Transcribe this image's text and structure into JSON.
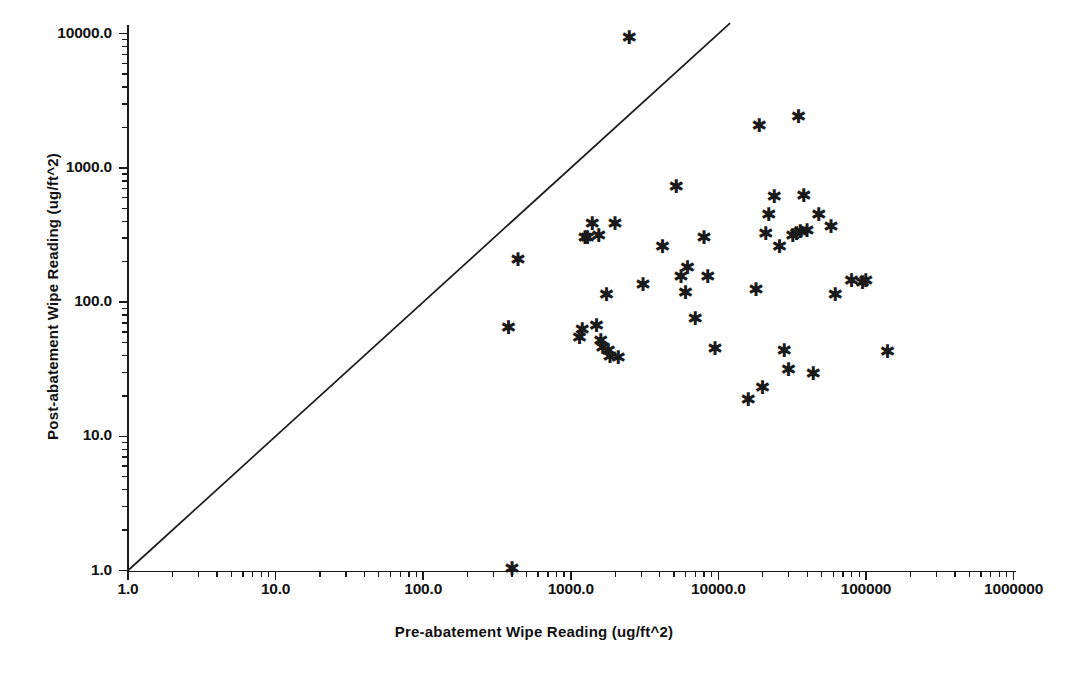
{
  "chart_data": {
    "type": "scatter",
    "title": "",
    "xlabel": "Pre-abatement Wipe Reading (ug/ft^2)",
    "ylabel": "Post-abatement Wipe Reading (ug/ft^2)",
    "xscale": "log",
    "yscale": "log",
    "xlim": [
      1,
      1000000
    ],
    "ylim": [
      1,
      10000
    ],
    "grid": false,
    "legend": null,
    "marker": "asterisk",
    "marker_color": "#1a1a1a",
    "xticks": [
      1,
      10,
      100,
      1000,
      10000,
      100000,
      1000000
    ],
    "xticklabels": [
      "1.0",
      "10.0",
      "100.0",
      "1000.0",
      "10000.0",
      "100000",
      "1000000"
    ],
    "yticks": [
      1,
      10,
      100,
      1000,
      10000
    ],
    "yticklabels": [
      "1.0",
      "10.0",
      "100.0",
      "1000.0",
      "10000.0"
    ],
    "reference_line": {
      "description": "y = x identity line",
      "x_start": 1.0,
      "y_start": 1.0,
      "x_end": 12000.0,
      "y_end": 12000.0,
      "color": "#1a1a1a"
    },
    "points": [
      {
        "x": 400,
        "y": 1.0
      },
      {
        "x": 380,
        "y": 62
      },
      {
        "x": 440,
        "y": 200
      },
      {
        "x": 1150,
        "y": 52
      },
      {
        "x": 1200,
        "y": 60
      },
      {
        "x": 1250,
        "y": 290
      },
      {
        "x": 1300,
        "y": 290
      },
      {
        "x": 1400,
        "y": 370
      },
      {
        "x": 1500,
        "y": 64
      },
      {
        "x": 1550,
        "y": 300
      },
      {
        "x": 1600,
        "y": 50
      },
      {
        "x": 1650,
        "y": 44
      },
      {
        "x": 1750,
        "y": 110
      },
      {
        "x": 1800,
        "y": 42
      },
      {
        "x": 1850,
        "y": 38
      },
      {
        "x": 2000,
        "y": 370
      },
      {
        "x": 2100,
        "y": 37
      },
      {
        "x": 2500,
        "y": 9000
      },
      {
        "x": 3100,
        "y": 130
      },
      {
        "x": 4200,
        "y": 250
      },
      {
        "x": 5200,
        "y": 700
      },
      {
        "x": 5600,
        "y": 150
      },
      {
        "x": 6000,
        "y": 113
      },
      {
        "x": 6200,
        "y": 175
      },
      {
        "x": 7000,
        "y": 72
      },
      {
        "x": 8000,
        "y": 290
      },
      {
        "x": 8500,
        "y": 150
      },
      {
        "x": 9500,
        "y": 43
      },
      {
        "x": 16000,
        "y": 18
      },
      {
        "x": 18000,
        "y": 120
      },
      {
        "x": 19000,
        "y": 2000
      },
      {
        "x": 20000,
        "y": 22
      },
      {
        "x": 21000,
        "y": 310
      },
      {
        "x": 22000,
        "y": 430
      },
      {
        "x": 24000,
        "y": 590
      },
      {
        "x": 26000,
        "y": 250
      },
      {
        "x": 28000,
        "y": 42
      },
      {
        "x": 30000,
        "y": 30
      },
      {
        "x": 32000,
        "y": 300
      },
      {
        "x": 34000,
        "y": 310
      },
      {
        "x": 35000,
        "y": 2300
      },
      {
        "x": 36000,
        "y": 320
      },
      {
        "x": 38000,
        "y": 600
      },
      {
        "x": 40000,
        "y": 330
      },
      {
        "x": 44000,
        "y": 28
      },
      {
        "x": 48000,
        "y": 430
      },
      {
        "x": 58000,
        "y": 350
      },
      {
        "x": 62000,
        "y": 110
      },
      {
        "x": 80000,
        "y": 140
      },
      {
        "x": 95000,
        "y": 135
      },
      {
        "x": 100000,
        "y": 140
      },
      {
        "x": 140000,
        "y": 41
      }
    ]
  }
}
